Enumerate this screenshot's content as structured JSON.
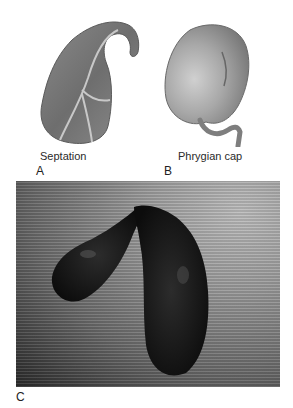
{
  "figure": {
    "panels": [
      {
        "letter": "A",
        "caption": "Septation",
        "icon": "septated-gallbladder-illustration"
      },
      {
        "letter": "B",
        "caption": "Phrygian cap",
        "icon": "phrygian-cap-gallbladder-illustration"
      },
      {
        "letter": "C",
        "caption": "",
        "icon": "bilobed-gallbladder-photo"
      }
    ]
  }
}
